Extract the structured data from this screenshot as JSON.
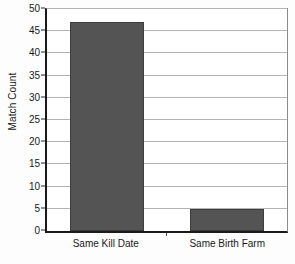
{
  "chart_data": {
    "type": "bar",
    "title": "",
    "subtitle": "",
    "xlabel": "",
    "ylabel": "Match Count",
    "categories": [
      "Same Kill Date",
      "Same Birth Farm"
    ],
    "values": [
      47,
      5
    ],
    "ylim": [
      0,
      50
    ],
    "y_ticks": [
      0,
      5,
      10,
      15,
      20,
      25,
      30,
      35,
      40,
      45,
      50
    ],
    "y_tick_labels": [
      "0",
      "5",
      "10",
      "15",
      "20",
      "25",
      "30",
      "35",
      "40",
      "45",
      "50"
    ],
    "grid": true,
    "legend": false,
    "legend_position": "none",
    "bar_color": "#545454",
    "gridline_color": "#b4b4b4",
    "axis_color": "#1a1a1a",
    "background_color": "#ffffff"
  }
}
